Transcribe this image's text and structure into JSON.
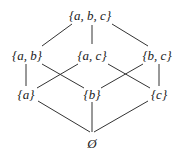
{
  "diagram": {
    "type": "hasse",
    "title": "",
    "nodes": [
      {
        "id": "abc",
        "label": "{a, b, c}",
        "x": 90,
        "y": 15
      },
      {
        "id": "ab",
        "label": "{a, b}",
        "x": 27,
        "y": 55
      },
      {
        "id": "ac",
        "label": "{a, c}",
        "x": 92,
        "y": 55
      },
      {
        "id": "bc",
        "label": "{b, c}",
        "x": 157,
        "y": 55
      },
      {
        "id": "a",
        "label": "{a}",
        "x": 26,
        "y": 94
      },
      {
        "id": "b",
        "label": "{b}",
        "x": 92,
        "y": 94
      },
      {
        "id": "c",
        "label": "{c}",
        "x": 159,
        "y": 94
      },
      {
        "id": "empty",
        "label": "Ø",
        "x": 92,
        "y": 143
      }
    ],
    "edges": [
      {
        "from": "abc",
        "to": "ab",
        "x1": 72,
        "y1": 24,
        "x2": 42,
        "y2": 46
      },
      {
        "from": "abc",
        "to": "ac",
        "x1": 92,
        "y1": 25,
        "x2": 92,
        "y2": 44
      },
      {
        "from": "abc",
        "to": "bc",
        "x1": 112,
        "y1": 24,
        "x2": 148,
        "y2": 46
      },
      {
        "from": "ab",
        "to": "a",
        "x1": 26,
        "y1": 64,
        "x2": 26,
        "y2": 86
      },
      {
        "from": "ab",
        "to": "b",
        "x1": 42,
        "y1": 64,
        "x2": 84,
        "y2": 88
      },
      {
        "from": "ac",
        "to": "a",
        "x1": 78,
        "y1": 64,
        "x2": 37,
        "y2": 88
      },
      {
        "from": "ac",
        "to": "c",
        "x1": 108,
        "y1": 64,
        "x2": 150,
        "y2": 88
      },
      {
        "from": "bc",
        "to": "b",
        "x1": 143,
        "y1": 64,
        "x2": 101,
        "y2": 88
      },
      {
        "from": "bc",
        "to": "c",
        "x1": 159,
        "y1": 64,
        "x2": 159,
        "y2": 86
      },
      {
        "from": "a",
        "to": "empty",
        "x1": 38,
        "y1": 101,
        "x2": 90,
        "y2": 132
      },
      {
        "from": "b",
        "to": "empty",
        "x1": 92,
        "y1": 102,
        "x2": 92,
        "y2": 132
      },
      {
        "from": "c",
        "to": "empty",
        "x1": 148,
        "y1": 101,
        "x2": 94,
        "y2": 132
      }
    ],
    "colors": {
      "line": "#333333",
      "text": "#222222",
      "background": "#ffffff"
    }
  }
}
